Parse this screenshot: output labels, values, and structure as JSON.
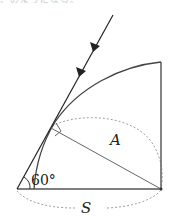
{
  "caption": "、のようになる。",
  "diagram": {
    "labels": {
      "angle": "60°",
      "segment": "A",
      "base": "S"
    },
    "colors": {
      "line": "#333333",
      "dashed": "#999999",
      "thin": "#666666"
    },
    "points": {
      "origin": [
        17,
        189
      ],
      "base_right": [
        161,
        189
      ],
      "vertical_top": [
        161,
        62
      ],
      "tangent_point": [
        51,
        128
      ],
      "ray_start": [
        113,
        15
      ]
    }
  }
}
